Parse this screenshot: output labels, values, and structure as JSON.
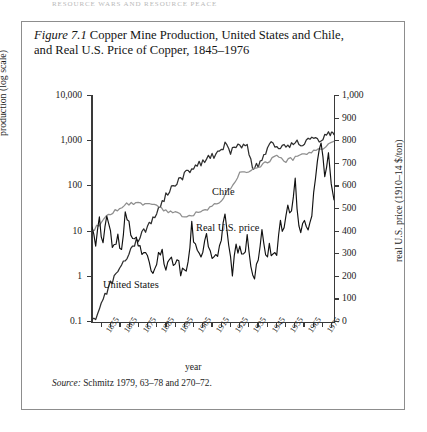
{
  "page_header": "resource wars and resource peace",
  "figure": {
    "label": "Figure 7.1",
    "title": "Copper Mine Production, United States and Chile, and Real U.S. Price of Copper, 1845–1976",
    "source_label": "Source:",
    "source_text": "Schmitz 1979, 63–78 and 270–72."
  },
  "chart_data": {
    "type": "line",
    "title": "Copper Mine Production, United States and Chile, and Real U.S. Price of Copper, 1845–1976",
    "xlabel": "year",
    "ylabel": "production (log scale)",
    "ylabel_right": "real U.S. price (1910–14 $/ton)",
    "xlim": [
      1845,
      1976
    ],
    "ylim_left": [
      0.1,
      10000
    ],
    "ylim_right": [
      0,
      1000
    ],
    "yscale_left": "log",
    "yscale_right": "linear",
    "grid": false,
    "legend_position": "inline-annotations",
    "yticks_left": [
      "10,000",
      "1,000",
      "100",
      "10",
      "1",
      "0.1"
    ],
    "yticks_right": [
      "1,000",
      "900",
      "800",
      "700",
      "600",
      "500",
      "400",
      "300",
      "200",
      "100",
      "0"
    ],
    "xticks": [
      "1855",
      "1865",
      "1875",
      "1885",
      "1895",
      "1905",
      "1915",
      "1925",
      "1935",
      "1945",
      "1955",
      "1965",
      "1975"
    ],
    "annotations": [
      {
        "text": "Chile",
        "series": "chile"
      },
      {
        "text": "Real U.S. price",
        "series": "real_us_price"
      },
      {
        "text": "United States",
        "series": "united_states"
      }
    ],
    "series": [
      {
        "name": "United States",
        "axis": "left",
        "units": "thousand metric tons",
        "color": "#2e2e2e",
        "x": [
          1845,
          1848,
          1851,
          1854,
          1857,
          1860,
          1863,
          1866,
          1869,
          1872,
          1875,
          1878,
          1881,
          1884,
          1887,
          1890,
          1893,
          1896,
          1899,
          1902,
          1905,
          1908,
          1911,
          1914,
          1917,
          1920,
          1923,
          1926,
          1929,
          1932,
          1935,
          1938,
          1941,
          1944,
          1947,
          1950,
          1953,
          1956,
          1959,
          1962,
          1965,
          1968,
          1971,
          1974,
          1976
        ],
        "values": [
          0.1,
          0.15,
          0.3,
          0.6,
          1.0,
          1.6,
          2.5,
          4.0,
          6.0,
          9.0,
          13,
          20,
          32,
          55,
          85,
          115,
          150,
          200,
          255,
          295,
          360,
          425,
          490,
          570,
          840,
          610,
          730,
          800,
          900,
          230,
          310,
          500,
          850,
          820,
          760,
          830,
          840,
          1000,
          830,
          1100,
          1200,
          1050,
          1380,
          1450,
          1400
        ]
      },
      {
        "name": "Chile",
        "axis": "left",
        "units": "thousand metric tons",
        "color": "#8f8f8f",
        "x": [
          1845,
          1850,
          1855,
          1860,
          1865,
          1870,
          1875,
          1880,
          1885,
          1890,
          1895,
          1900,
          1905,
          1910,
          1915,
          1920,
          1925,
          1930,
          1935,
          1940,
          1945,
          1950,
          1955,
          1960,
          1965,
          1970,
          1976
        ],
        "values": [
          10,
          16,
          25,
          32,
          42,
          45,
          40,
          36,
          30,
          26,
          22,
          25,
          29,
          34,
          52,
          95,
          190,
          220,
          270,
          360,
          470,
          370,
          430,
          530,
          580,
          690,
          1000
        ]
      },
      {
        "name": "Real U.S. price",
        "axis": "right",
        "units": "1910-14 $/ton",
        "color": "#111111",
        "x": [
          1845,
          1847,
          1849,
          1851,
          1853,
          1855,
          1857,
          1859,
          1861,
          1863,
          1865,
          1867,
          1869,
          1871,
          1873,
          1875,
          1877,
          1879,
          1881,
          1883,
          1885,
          1887,
          1889,
          1891,
          1893,
          1895,
          1897,
          1899,
          1901,
          1903,
          1905,
          1907,
          1909,
          1911,
          1913,
          1915,
          1917,
          1919,
          1921,
          1923,
          1925,
          1927,
          1929,
          1931,
          1933,
          1935,
          1937,
          1939,
          1941,
          1943,
          1945,
          1947,
          1949,
          1951,
          1953,
          1955,
          1957,
          1959,
          1961,
          1963,
          1965,
          1967,
          1969,
          1971,
          1973,
          1976
        ],
        "values": [
          420,
          330,
          450,
          360,
          480,
          390,
          330,
          400,
          300,
          480,
          420,
          360,
          390,
          330,
          290,
          310,
          250,
          230,
          330,
          310,
          230,
          290,
          250,
          260,
          230,
          240,
          250,
          430,
          320,
          290,
          330,
          420,
          300,
          290,
          300,
          390,
          460,
          340,
          230,
          320,
          330,
          300,
          360,
          250,
          220,
          260,
          380,
          300,
          330,
          300,
          300,
          430,
          390,
          530,
          480,
          620,
          420,
          430,
          430,
          420,
          560,
          700,
          800,
          620,
          720,
          540
        ]
      }
    ]
  }
}
